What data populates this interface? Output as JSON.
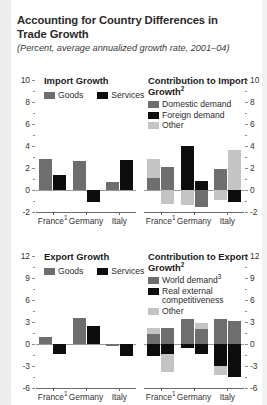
{
  "header": {
    "title": "Accounting for Country Differences in Trade Growth",
    "subtitle": "(Percent, average annualized growth rate, 2001–04)"
  },
  "chart_data": [
    {
      "id": "import-growth",
      "type": "bar",
      "title": "Import Growth",
      "title_sup": "",
      "categories": [
        "France",
        "Germany",
        "Italy"
      ],
      "category_sups": [
        "1",
        "",
        ""
      ],
      "legend_position": "top-left",
      "legend": [
        "Goods",
        "Services"
      ],
      "series": [
        {
          "name": "Goods",
          "color": "#6e6e6e",
          "values": [
            2.8,
            2.6,
            0.7
          ]
        },
        {
          "name": "Services",
          "color": "#0d0d0d",
          "values": [
            1.4,
            -1.1,
            2.7
          ]
        }
      ],
      "ylim": [
        -2,
        10
      ],
      "yticks": [
        -2,
        0,
        2,
        4,
        6,
        8,
        10
      ],
      "ytick_labels": [
        "-2",
        "0",
        "2",
        "4",
        "6",
        "8",
        "10"
      ],
      "axis_side": "left",
      "grid": false
    },
    {
      "id": "contribution-to-import-growth",
      "type": "bar",
      "title": "Contribution to Import Growth",
      "title_sup": "2",
      "categories": [
        "France",
        "Germany",
        "Italy"
      ],
      "category_sups": [
        "1",
        "",
        ""
      ],
      "legend_position": "top-left",
      "legend": [
        "Domestic demand",
        "Foreign demand",
        "Other"
      ],
      "stacked": true,
      "groups": [
        {
          "category": "France",
          "bars": [
            {
              "segments": [
                {
                  "name": "Domestic demand",
                  "color": "#6e6e6e",
                  "value": 1.1
                },
                {
                  "name": "Other",
                  "color": "#c4c4c4",
                  "value": 1.7
                }
              ]
            },
            {
              "segments": [
                {
                  "name": "Domestic demand",
                  "color": "#6e6e6e",
                  "value": 2.1
                },
                {
                  "name": "Other",
                  "color": "#c4c4c4",
                  "value": -1.3
                }
              ]
            }
          ]
        },
        {
          "category": "Germany",
          "bars": [
            {
              "segments": [
                {
                  "name": "Foreign demand",
                  "color": "#0d0d0d",
                  "value": 4.0
                },
                {
                  "name": "Other",
                  "color": "#c4c4c4",
                  "value": -1.4
                }
              ]
            },
            {
              "segments": [
                {
                  "name": "Foreign demand",
                  "color": "#0d0d0d",
                  "value": 0.8
                },
                {
                  "name": "Domestic demand",
                  "color": "#6e6e6e",
                  "value": -1.5
                }
              ]
            }
          ]
        },
        {
          "category": "Italy",
          "bars": [
            {
              "segments": [
                {
                  "name": "Domestic demand",
                  "color": "#6e6e6e",
                  "value": 1.9
                },
                {
                  "name": "Other",
                  "color": "#c4c4c4",
                  "value": -0.9
                }
              ]
            },
            {
              "segments": [
                {
                  "name": "Other",
                  "color": "#c4c4c4",
                  "value": 3.6
                },
                {
                  "name": "Foreign demand",
                  "color": "#0d0d0d",
                  "value": -1.1
                }
              ]
            }
          ]
        }
      ],
      "ylim": [
        -2,
        10
      ],
      "yticks": [
        -2,
        0,
        2,
        4,
        6,
        8,
        10
      ],
      "ytick_labels": [
        "-2",
        "0",
        "2",
        "4",
        "6",
        "8",
        "10"
      ],
      "axis_side": "right",
      "grid": false
    },
    {
      "id": "export-growth",
      "type": "bar",
      "title": "Export Growth",
      "title_sup": "",
      "categories": [
        "France",
        "Germany",
        "Italy"
      ],
      "category_sups": [
        "1",
        "",
        ""
      ],
      "legend_position": "top-left",
      "legend": [
        "Goods",
        "Services"
      ],
      "series": [
        {
          "name": "Goods",
          "color": "#6e6e6e",
          "values": [
            0.9,
            3.6,
            -0.3
          ]
        },
        {
          "name": "Services",
          "color": "#0d0d0d",
          "values": [
            -1.4,
            2.5,
            -1.6
          ]
        }
      ],
      "ylim": [
        -6,
        12
      ],
      "yticks": [
        -6,
        -3,
        0,
        3,
        6,
        9,
        12
      ],
      "ytick_labels": [
        "-6",
        "-3",
        "0",
        "3",
        "6",
        "9",
        "12"
      ],
      "axis_side": "left",
      "grid": false
    },
    {
      "id": "contribution-to-export-growth",
      "type": "bar",
      "title": "Contribution to Export Growth",
      "title_sup": "2",
      "categories": [
        "France",
        "Germany",
        "Italy"
      ],
      "category_sups": [
        "1",
        "",
        ""
      ],
      "legend_position": "top-left",
      "legend": [
        "World demand",
        "Real external competitiveness",
        "Other"
      ],
      "legend_sups": [
        "3",
        "",
        ""
      ],
      "stacked": true,
      "groups": [
        {
          "category": "France",
          "bars": [
            {
              "segments": [
                {
                  "name": "World demand",
                  "color": "#6e6e6e",
                  "value": 1.4
                },
                {
                  "name": "Other",
                  "color": "#c4c4c4",
                  "value": 0.8
                },
                {
                  "name": "Real external competitiveness",
                  "color": "#0d0d0d",
                  "value": -1.6
                }
              ]
            },
            {
              "segments": [
                {
                  "name": "World demand",
                  "color": "#6e6e6e",
                  "value": 2.2
                },
                {
                  "name": "Real external competitiveness",
                  "color": "#0d0d0d",
                  "value": -1.4
                },
                {
                  "name": "Other",
                  "color": "#c4c4c4",
                  "value": -2.4
                }
              ]
            }
          ]
        },
        {
          "category": "Germany",
          "bars": [
            {
              "segments": [
                {
                  "name": "World demand",
                  "color": "#6e6e6e",
                  "value": 3.4
                },
                {
                  "name": "Real external competitiveness",
                  "color": "#0d0d0d",
                  "value": -0.6
                }
              ]
            },
            {
              "segments": [
                {
                  "name": "World demand",
                  "color": "#6e6e6e",
                  "value": 2.1
                },
                {
                  "name": "Other",
                  "color": "#c4c4c4",
                  "value": 0.7
                },
                {
                  "name": "Real external competitiveness",
                  "color": "#0d0d0d",
                  "value": -1.3
                }
              ]
            }
          ]
        },
        {
          "category": "Italy",
          "bars": [
            {
              "segments": [
                {
                  "name": "World demand",
                  "color": "#6e6e6e",
                  "value": 3.4
                },
                {
                  "name": "Real external competitiveness",
                  "color": "#0d0d0d",
                  "value": -3.0
                },
                {
                  "name": "Other",
                  "color": "#c4c4c4",
                  "value": -1.2
                }
              ]
            },
            {
              "segments": [
                {
                  "name": "World demand",
                  "color": "#6e6e6e",
                  "value": 3.1
                },
                {
                  "name": "Real external competitiveness",
                  "color": "#0d0d0d",
                  "value": -4.5
                }
              ]
            }
          ]
        }
      ],
      "ylim": [
        -6,
        12
      ],
      "yticks": [
        -6,
        -3,
        0,
        3,
        6,
        9,
        12
      ],
      "ytick_labels": [
        "-6",
        "-3",
        "0",
        "3",
        "6",
        "9",
        "12"
      ],
      "axis_side": "right",
      "grid": false
    }
  ]
}
